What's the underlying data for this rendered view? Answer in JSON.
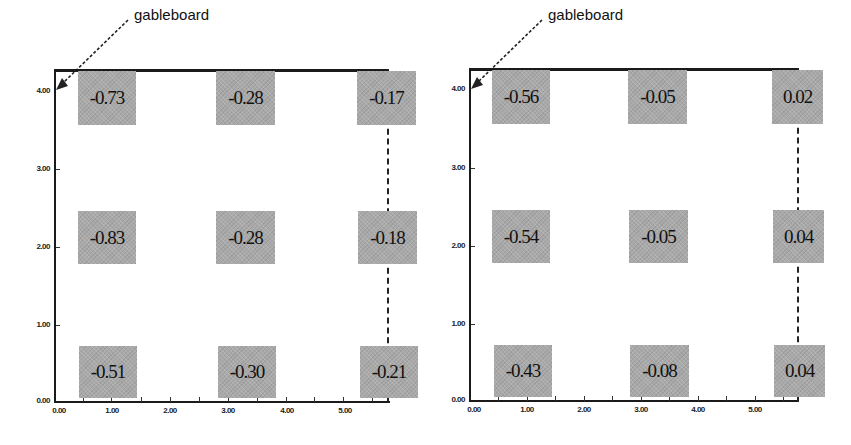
{
  "panels": [
    {
      "annotation": "gableboard",
      "y_ticks": [
        "4.00",
        "3.00",
        "2.00",
        "1.00",
        "0.00"
      ],
      "x_ticks": [
        "0.00",
        "1.00",
        "2.00",
        "3.00",
        "4.00",
        "5.00"
      ],
      "grid": [
        [
          "-0.73",
          "-0.28",
          "-0.17"
        ],
        [
          "-0.83",
          "-0.28",
          "-0.18"
        ],
        [
          "-0.51",
          "-0.30",
          "-0.21"
        ]
      ]
    },
    {
      "annotation": "gableboard",
      "y_ticks": [
        "4.00",
        "3.00",
        "2.00",
        "1.00",
        "0.00"
      ],
      "x_ticks": [
        "0.00",
        "1.00",
        "2.00",
        "3.00",
        "4.00",
        "5.00"
      ],
      "grid": [
        [
          "-0.56",
          "-0.05",
          "0.02"
        ],
        [
          "-0.54",
          "-0.05",
          "0.04"
        ],
        [
          "-0.43",
          "-0.08",
          "0.04"
        ]
      ]
    }
  ],
  "colors": {
    "cell_fill": "#a9a9a9",
    "line": "#1a1a1a",
    "background": "#ffffff"
  }
}
